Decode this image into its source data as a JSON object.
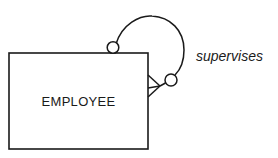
{
  "diagram": {
    "type": "er-diagram",
    "notation": "crow's foot",
    "entities": [
      {
        "name": "EMPLOYEE"
      }
    ],
    "relationships": [
      {
        "label": "supervises",
        "from": "EMPLOYEE",
        "to": "EMPLOYEE",
        "recursive": true,
        "end_top": {
          "cardinality": "zero-or-one",
          "symbol": "circle"
        },
        "end_right": {
          "cardinality": "zero-or-many",
          "symbol": "circle + crow's foot"
        }
      }
    ]
  },
  "colors": {
    "stroke": "#1a1a1a",
    "background": "#ffffff"
  }
}
